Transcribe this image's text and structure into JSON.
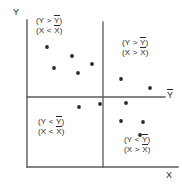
{
  "figure": {
    "type": "scatter",
    "style": "hand-drawn quadrant scatter plot",
    "background_color": "#ffffff",
    "ink_color": "#3a3a3a"
  },
  "axes": {
    "y_axis_label": "Y",
    "x_axis_label": "X",
    "mean_line_label": "Y",
    "mean_line_label_overbar": true,
    "frame": {
      "left_x": 27,
      "bottom_y": 167,
      "top_y": 20,
      "right_x": 178
    },
    "mean_lines": {
      "horizontal_y": 97,
      "horizontal_x_start": 27,
      "horizontal_x_end": 165,
      "vertical_x": 103,
      "vertical_y_start": 22,
      "vertical_y_end": 167
    }
  },
  "quadrants": [
    {
      "name": "top-left",
      "line1": "(Y > Y)",
      "line2": "(X < X)",
      "y_symbol": "Y",
      "x_symbol": "X",
      "y_relation": ">",
      "x_relation": "<",
      "left": 36,
      "top": 16
    },
    {
      "name": "top-right",
      "line1": "(Y > Y)",
      "line2": "(X > X)",
      "y_symbol": "Y",
      "x_symbol": "X",
      "y_relation": ">",
      "x_relation": ">",
      "left": 122,
      "top": 38
    },
    {
      "name": "bottom-left",
      "line1": "(Y < Y)",
      "line2": "(X < X)",
      "y_symbol": "Y",
      "x_symbol": "X",
      "y_relation": "<",
      "x_relation": "<",
      "left": 38,
      "top": 117
    },
    {
      "name": "bottom-right",
      "line1": "(Y < Y)",
      "line2": "(X > X)",
      "y_symbol": "Y",
      "x_symbol": "X",
      "y_relation": "<",
      "x_relation": ">",
      "left": 124,
      "top": 135
    }
  ],
  "chart_data": {
    "type": "scatter",
    "title": "",
    "xlabel": "X",
    "ylabel": "Y",
    "grid": false,
    "legend": false,
    "axis_ranges": {
      "x_pixels": [
        27,
        178
      ],
      "y_pixels": [
        20,
        167
      ]
    },
    "reference_lines": [
      {
        "orientation": "horizontal",
        "label": "Y-bar",
        "pixel": 97
      },
      {
        "orientation": "vertical",
        "label": "X-bar",
        "pixel": 103
      }
    ],
    "points_pixel": [
      {
        "x": 47,
        "y": 47,
        "quadrant": "top-left"
      },
      {
        "x": 72,
        "y": 56,
        "quadrant": "top-left"
      },
      {
        "x": 54,
        "y": 68,
        "quadrant": "top-left"
      },
      {
        "x": 78,
        "y": 73,
        "quadrant": "top-left"
      },
      {
        "x": 92,
        "y": 64,
        "quadrant": "top-left"
      },
      {
        "x": 121,
        "y": 79,
        "quadrant": "top-right"
      },
      {
        "x": 150,
        "y": 88,
        "quadrant": "top-right"
      },
      {
        "x": 79,
        "y": 107,
        "quadrant": "bottom-left"
      },
      {
        "x": 100,
        "y": 104,
        "quadrant": "bottom-left"
      },
      {
        "x": 126,
        "y": 103,
        "quadrant": "bottom-right"
      },
      {
        "x": 121,
        "y": 121,
        "quadrant": "bottom-right"
      },
      {
        "x": 143,
        "y": 122,
        "quadrant": "bottom-right"
      },
      {
        "x": 140,
        "y": 135,
        "quadrant": "bottom-right"
      }
    ],
    "point_count": 13,
    "point_color": "#2b2b2b",
    "point_radius": 1.9
  }
}
